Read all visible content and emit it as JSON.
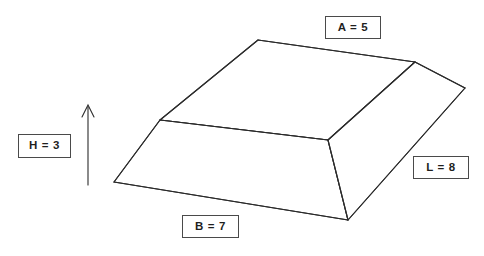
{
  "diagram": {
    "background_color": "#ffffff",
    "line_color": "#2b2b2b",
    "line_width": 1.1,
    "labels": {
      "top_face": {
        "id": "A",
        "text": "A = 5",
        "value": 5,
        "symbol": "A",
        "describes": "top face width"
      },
      "right_side": {
        "id": "L",
        "text": "L = 8",
        "value": 8,
        "symbol": "L",
        "describes": "length"
      },
      "bottom_face": {
        "id": "B",
        "text": "B = 7",
        "value": 7,
        "symbol": "B",
        "describes": "base width"
      },
      "height": {
        "id": "H",
        "text": "H = 3",
        "value": 3,
        "symbol": "H",
        "describes": "height"
      }
    },
    "height_arrow": {
      "name": "height-arrow",
      "direction": "up",
      "x": 88,
      "y_start": 185,
      "y_end": 105
    },
    "geometry": {
      "top_face": [
        [
          258,
          40
        ],
        [
          415,
          62
        ],
        [
          328,
          140
        ],
        [
          160,
          120
        ]
      ],
      "base_front_left": [
        114,
        182
      ],
      "base_front_bottom": [
        348,
        220
      ],
      "base_right": [
        465,
        88
      ],
      "edges": [
        {
          "name": "top-back-left",
          "from": [
            258,
            40
          ],
          "to": [
            415,
            62
          ]
        },
        {
          "name": "top-back-right",
          "from": [
            415,
            62
          ],
          "to": [
            328,
            140
          ]
        },
        {
          "name": "top-front",
          "from": [
            328,
            140
          ],
          "to": [
            160,
            120
          ]
        },
        {
          "name": "top-left",
          "from": [
            160,
            120
          ],
          "to": [
            258,
            40
          ]
        },
        {
          "name": "slope-left",
          "from": [
            160,
            120
          ],
          "to": [
            114,
            182
          ]
        },
        {
          "name": "base-front",
          "from": [
            114,
            182
          ],
          "to": [
            348,
            220
          ]
        },
        {
          "name": "slope-front",
          "from": [
            328,
            140
          ],
          "to": [
            348,
            220
          ]
        },
        {
          "name": "base-right",
          "from": [
            348,
            220
          ],
          "to": [
            465,
            88
          ]
        },
        {
          "name": "slope-right",
          "from": [
            465,
            88
          ],
          "to": [
            415,
            62
          ]
        }
      ]
    }
  }
}
